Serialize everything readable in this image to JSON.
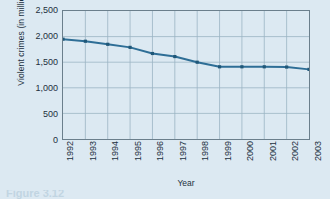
{
  "chart_data": {
    "type": "line",
    "title": "",
    "xlabel": "Year",
    "ylabel": "Violent crimes (in millions)",
    "categories": [
      "1992",
      "1993",
      "1994",
      "1995",
      "1996",
      "1997",
      "1998",
      "1999",
      "2000",
      "2001",
      "2002",
      "2003"
    ],
    "values": [
      1950,
      1910,
      1850,
      1790,
      1670,
      1610,
      1500,
      1410,
      1410,
      1410,
      1405,
      1360
    ],
    "series": [
      {
        "name": "Violent crimes",
        "values": [
          1950,
          1910,
          1850,
          1790,
          1670,
          1610,
          1500,
          1410,
          1410,
          1410,
          1405,
          1360
        ]
      }
    ],
    "ylim": [
      0,
      2500
    ],
    "ytick_values": [
      0,
      500,
      1000,
      1500,
      2000,
      2500
    ],
    "ytick_labels": [
      "0",
      "500",
      "1,000",
      "1,500",
      "2,000",
      "2,500"
    ],
    "grid": true,
    "legend": "none",
    "marker": "square",
    "line_color": "#2e6e96",
    "marker_color": "#1f5778",
    "grid_color": "#9bb4c4",
    "axis_color": "#6b7f8c",
    "background_color": "#dce9f2",
    "text_color": "#1c3040"
  },
  "caption": {
    "text": "Figure  3.12"
  }
}
